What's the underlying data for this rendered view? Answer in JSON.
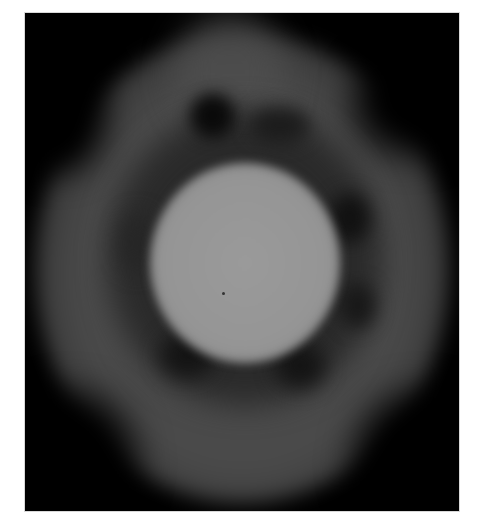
{
  "image": {
    "description": "Grayscale fluorescence-style micrograph: bright central disk surrounded by a dimmer gray ring with dark spots, on a black background",
    "colors": {
      "background": "#000000",
      "ring": "#4a4a4a",
      "ring_dark_spots": "#111111",
      "core": "#9a9a9a",
      "page": "#ffffff"
    },
    "frame": {
      "x": 25,
      "y": 13,
      "width": 434,
      "height": 498
    }
  }
}
